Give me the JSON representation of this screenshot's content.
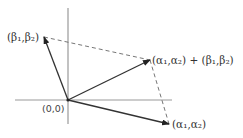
{
  "diagram": {
    "type": "vector-addition",
    "colors": {
      "axis": "#999999",
      "vector": "#333333",
      "dashed": "#666666",
      "text": "#333333"
    },
    "labels": {
      "origin": "(0,0)",
      "beta": "(β₁,β₂)",
      "alpha": "(α₁,α₂)",
      "sum": "(α₁,α₂) + (β₁,β₂)"
    },
    "points": {
      "origin": [
        68,
        100
      ],
      "beta": [
        44,
        37
      ],
      "alpha": [
        169,
        124
      ],
      "sum": [
        150,
        60
      ]
    }
  }
}
